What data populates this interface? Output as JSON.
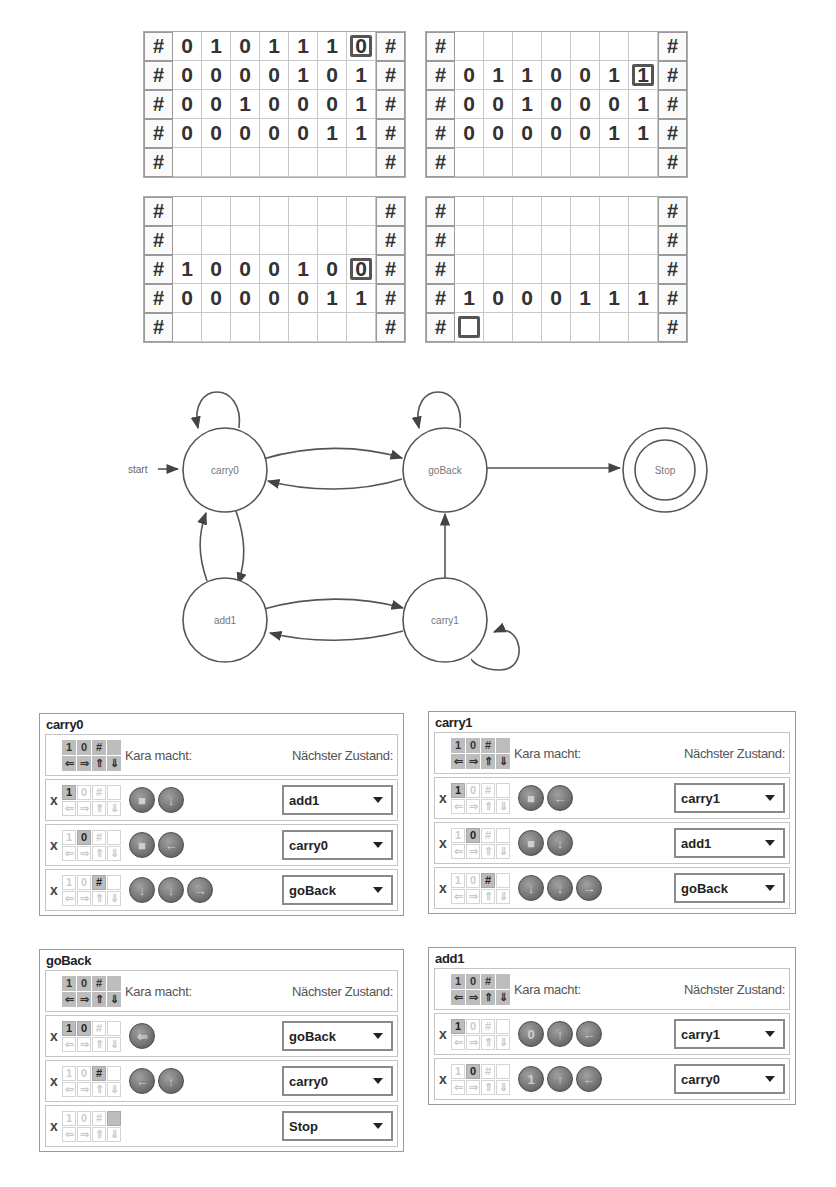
{
  "worlds": [
    {
      "name": "world-1",
      "rows": [
        [
          "#",
          "0",
          "1",
          "0",
          "1",
          "1",
          "1",
          "0",
          "#"
        ],
        [
          "#",
          "0",
          "0",
          "0",
          "0",
          "1",
          "0",
          "1",
          "#"
        ],
        [
          "#",
          "0",
          "0",
          "1",
          "0",
          "0",
          "0",
          "1",
          "#"
        ],
        [
          "#",
          "0",
          "0",
          "0",
          "0",
          "0",
          "1",
          "1",
          "#"
        ],
        [
          "#",
          "",
          "",
          "",
          "",
          "",
          "",
          "",
          "#"
        ]
      ],
      "kara": [
        0,
        7
      ]
    },
    {
      "name": "world-2",
      "rows": [
        [
          "#",
          "",
          "",
          "",
          "",
          "",
          "",
          "",
          "#"
        ],
        [
          "#",
          "0",
          "1",
          "1",
          "0",
          "0",
          "1",
          "1",
          "#"
        ],
        [
          "#",
          "0",
          "0",
          "1",
          "0",
          "0",
          "0",
          "1",
          "#"
        ],
        [
          "#",
          "0",
          "0",
          "0",
          "0",
          "0",
          "1",
          "1",
          "#"
        ],
        [
          "#",
          "",
          "",
          "",
          "",
          "",
          "",
          "",
          "#"
        ]
      ],
      "kara": [
        1,
        7
      ]
    },
    {
      "name": "world-3",
      "rows": [
        [
          "#",
          "",
          "",
          "",
          "",
          "",
          "",
          "",
          "#"
        ],
        [
          "#",
          "",
          "",
          "",
          "",
          "",
          "",
          "",
          "#"
        ],
        [
          "#",
          "1",
          "0",
          "0",
          "0",
          "1",
          "0",
          "0",
          "#"
        ],
        [
          "#",
          "0",
          "0",
          "0",
          "0",
          "0",
          "1",
          "1",
          "#"
        ],
        [
          "#",
          "",
          "",
          "",
          "",
          "",
          "",
          "",
          "#"
        ]
      ],
      "kara": [
        2,
        7
      ]
    },
    {
      "name": "world-4",
      "rows": [
        [
          "#",
          "",
          "",
          "",
          "",
          "",
          "",
          "",
          "#"
        ],
        [
          "#",
          "",
          "",
          "",
          "",
          "",
          "",
          "",
          "#"
        ],
        [
          "#",
          "",
          "",
          "",
          "",
          "",
          "",
          "",
          "#"
        ],
        [
          "#",
          "1",
          "0",
          "0",
          "0",
          "1",
          "1",
          "1",
          "#"
        ],
        [
          "#",
          "",
          "",
          "",
          "",
          "",
          "",
          "",
          "#"
        ]
      ],
      "kara": [
        4,
        1
      ]
    }
  ],
  "diagram": {
    "start_label": "start",
    "states": [
      {
        "id": "carry0",
        "label": "carry0",
        "cx": 230,
        "cy": 120,
        "final": false
      },
      {
        "id": "goBack",
        "label": "goBack",
        "cx": 450,
        "cy": 120,
        "final": false
      },
      {
        "id": "Stop",
        "label": "Stop",
        "cx": 670,
        "cy": 120,
        "final": true
      },
      {
        "id": "add1",
        "label": "add1",
        "cx": 230,
        "cy": 270,
        "final": false
      },
      {
        "id": "carry1",
        "label": "carry1",
        "cx": 450,
        "cy": 270,
        "final": false
      }
    ]
  },
  "panels": {
    "header": {
      "sensors_top": [
        "1",
        "0",
        "#",
        ""
      ],
      "sensors_bottom": [
        "⇐",
        "⇒",
        "⇑",
        "⇓"
      ],
      "kara_label": "Kara macht:",
      "next_label": "Nächster Zustand:"
    },
    "x_mark": "x",
    "states": [
      {
        "title": "carry0",
        "rows": [
          {
            "sensor": 0,
            "actions": [
              "■",
              "↓"
            ],
            "next": "add1"
          },
          {
            "sensor": 1,
            "actions": [
              "■",
              "←"
            ],
            "next": "carry0"
          },
          {
            "sensor": 2,
            "actions": [
              "↓",
              "↓",
              "→"
            ],
            "next": "goBack"
          }
        ]
      },
      {
        "title": "carry1",
        "rows": [
          {
            "sensor": 0,
            "actions": [
              "■",
              "←"
            ],
            "next": "carry1"
          },
          {
            "sensor": 1,
            "actions": [
              "■",
              "↓"
            ],
            "next": "add1"
          },
          {
            "sensor": 2,
            "actions": [
              "↓",
              "↓",
              "→"
            ],
            "next": "goBack"
          }
        ]
      },
      {
        "title": "goBack",
        "rows": [
          {
            "sensor": [
              0,
              1
            ],
            "actions": [
              "⇐"
            ],
            "next": "goBack"
          },
          {
            "sensor": 2,
            "actions": [
              "←",
              "↑"
            ],
            "next": "carry0"
          },
          {
            "sensor": 3,
            "actions": [],
            "next": "Stop"
          }
        ]
      },
      {
        "title": "add1",
        "rows": [
          {
            "sensor": 0,
            "actions": [
              "0",
              "↑",
              "←"
            ],
            "next": "carry1"
          },
          {
            "sensor": 1,
            "actions": [
              "1",
              "↑",
              "←"
            ],
            "next": "carry0"
          }
        ]
      }
    ]
  }
}
